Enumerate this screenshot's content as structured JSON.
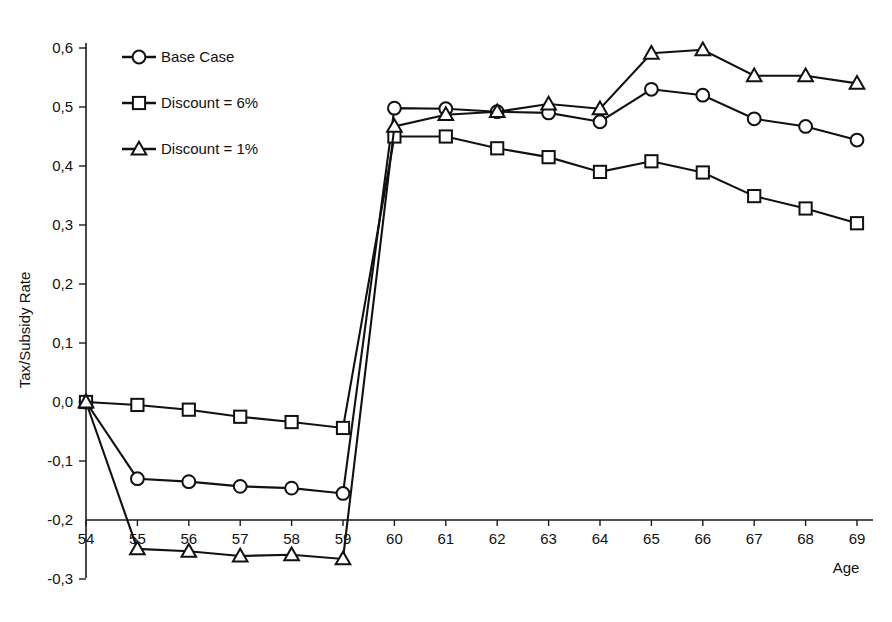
{
  "chart_data": {
    "type": "line",
    "title": "",
    "subtitle": "",
    "xlabel": "Age",
    "ylabel": "Tax/Subsidy Rate",
    "x": [
      54,
      55,
      56,
      57,
      58,
      59,
      60,
      61,
      62,
      63,
      64,
      65,
      66,
      67,
      68,
      69
    ],
    "categories": [
      "54",
      "55",
      "56",
      "57",
      "58",
      "59",
      "60",
      "61",
      "62",
      "63",
      "64",
      "65",
      "66",
      "67",
      "68",
      "69"
    ],
    "xlim": [
      54,
      69
    ],
    "ylim": [
      -0.3,
      0.6
    ],
    "y_ticks": [
      -0.3,
      -0.2,
      -0.1,
      0.0,
      0.1,
      0.2,
      0.3,
      0.4,
      0.5,
      0.6
    ],
    "y_tick_labels": [
      "-0,3",
      "-0,2",
      "-0,1",
      "0,0",
      "0,1",
      "0,2",
      "0,3",
      "0,4",
      "0,5",
      "0,6"
    ],
    "x_tick_labels": [
      "54",
      "55",
      "56",
      "57",
      "58",
      "59",
      "60",
      "61",
      "62",
      "63",
      "64",
      "65",
      "66",
      "67",
      "68",
      "69"
    ],
    "grid": false,
    "decimal_separator": ",",
    "legend_position": "upper-left-inside",
    "series": [
      {
        "name": "Base Case",
        "marker": "circle",
        "color": "#111111",
        "values": [
          0.0,
          -0.13,
          -0.135,
          -0.143,
          -0.146,
          -0.155,
          0.498,
          0.497,
          0.492,
          0.49,
          0.475,
          0.53,
          0.52,
          0.48,
          0.467,
          0.444
        ]
      },
      {
        "name": "Discount = 6%",
        "marker": "square",
        "color": "#111111",
        "values": [
          0.0,
          -0.005,
          -0.013,
          -0.025,
          -0.034,
          -0.044,
          0.45,
          0.45,
          0.43,
          0.415,
          0.39,
          0.408,
          0.389,
          0.349,
          0.328,
          0.303
        ]
      },
      {
        "name": "Discount = 1%",
        "marker": "triangle",
        "color": "#111111",
        "values": [
          0.0,
          -0.249,
          -0.253,
          -0.261,
          -0.259,
          -0.266,
          0.467,
          0.487,
          0.492,
          0.505,
          0.497,
          0.591,
          0.597,
          0.553,
          0.553,
          0.54
        ]
      }
    ]
  },
  "legend": {
    "entries": [
      {
        "label": "Base Case",
        "marker": "circle-marker"
      },
      {
        "label": "Discount = 6%",
        "marker": "square-marker"
      },
      {
        "label": "Discount = 1%",
        "marker": "triangle-marker"
      }
    ]
  },
  "axes": {
    "y_title": "Tax/Subsidy Rate",
    "x_title": "Age"
  }
}
